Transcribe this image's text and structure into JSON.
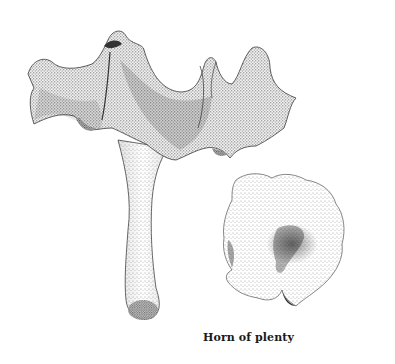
{
  "illustration": {
    "subject": "Horn of plenty mushroom, stipple drawing",
    "views": [
      "side view",
      "top view"
    ],
    "caption": "Horn of plenty",
    "ink_color": "#2a2a2a",
    "paper_color": "#ffffff"
  }
}
